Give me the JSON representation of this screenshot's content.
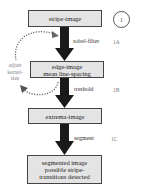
{
  "diagram": {
    "nodes": [
      {
        "id": "stripe-image",
        "lines": [
          "stripe-image"
        ]
      },
      {
        "id": "edge-image",
        "lines": [
          "edge-image",
          "mean line-spacing"
        ]
      },
      {
        "id": "extrema-image",
        "lines": [
          "extrema-image"
        ]
      },
      {
        "id": "segmented-image",
        "lines": [
          "segmented image",
          "possible stripe-",
          "transitions detected"
        ]
      }
    ],
    "edges": [
      {
        "from": "stripe-image",
        "to": "edge-image",
        "label": "sobel-filter",
        "step": "1A"
      },
      {
        "from": "edge-image",
        "to": "extrema-image",
        "label": "treshold",
        "step": "1B"
      },
      {
        "from": "extrema-image",
        "to": "segmented-image",
        "label": "segment",
        "step": "1C"
      }
    ],
    "feedback_loop": {
      "label_lines": [
        "adjust",
        "kernel-",
        "size"
      ]
    },
    "stage_marker": "I"
  }
}
